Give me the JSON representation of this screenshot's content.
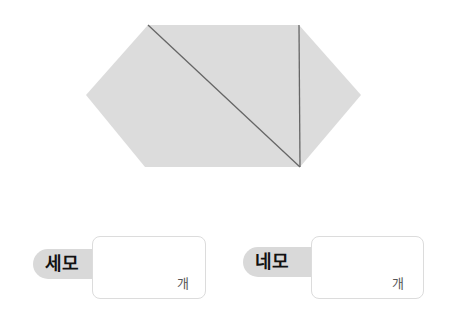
{
  "figure": {
    "shape": "hexagon",
    "fill": "#dcdcdc",
    "line_color": "#666666",
    "points": [
      [
        148,
        25
      ],
      [
        299,
        25
      ],
      [
        361,
        95
      ],
      [
        300,
        167
      ],
      [
        145,
        167
      ],
      [
        86,
        95
      ]
    ],
    "lines": [
      {
        "from": [
          148,
          25
        ],
        "to": [
          300,
          167
        ]
      },
      {
        "from": [
          299,
          25
        ],
        "to": [
          300,
          167
        ]
      }
    ]
  },
  "answers": [
    {
      "label": "세모",
      "value": "",
      "unit": "개"
    },
    {
      "label": "네모",
      "value": "",
      "unit": "개"
    }
  ],
  "colors": {
    "pill": "#d9d9d9",
    "box_border": "#dcdcdc"
  }
}
